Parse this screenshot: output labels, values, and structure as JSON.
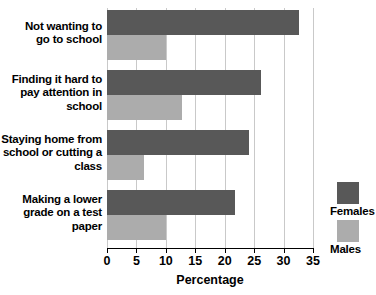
{
  "chart_data": {
    "type": "bar",
    "orientation": "horizontal",
    "title": "",
    "xlabel": "Percentage",
    "ylabel": "",
    "xlim": [
      0,
      35
    ],
    "xticks": [
      0,
      5,
      10,
      15,
      20,
      25,
      30,
      35
    ],
    "xtick_labels": [
      "0",
      "5",
      "10",
      "15",
      "20",
      "25",
      "30",
      "35"
    ],
    "grid": true,
    "legend_position": "right",
    "categories": [
      "Not wanting to go to school",
      "Finding it hard to pay attention in school",
      "Staying home from school or cutting a class",
      "Making a lower grade on a test paper"
    ],
    "category_lines": [
      [
        "Not wanting to",
        "go to school"
      ],
      [
        "Finding it hard to",
        "pay attention in",
        "school"
      ],
      [
        "Staying home from",
        "school or cutting a",
        "class"
      ],
      [
        "Making a lower",
        "grade on a test",
        "paper"
      ]
    ],
    "series": [
      {
        "name": "Females",
        "color": "#585858",
        "values": [
          32.6,
          26.2,
          24.2,
          21.8
        ]
      },
      {
        "name": "Males",
        "color": "#acacac",
        "values": [
          10.0,
          12.7,
          6.3,
          10.0
        ]
      }
    ]
  },
  "legend": {
    "entries": [
      {
        "label": "Females",
        "color": "#585858"
      },
      {
        "label": "Males",
        "color": "#acacac"
      }
    ]
  }
}
